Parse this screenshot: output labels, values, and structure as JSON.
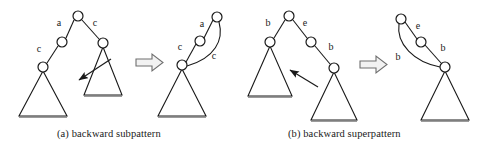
{
  "figure": {
    "width": 489,
    "height": 157,
    "background": "#ffffff",
    "stroke_color": "#1a1a1a",
    "node_fill": "#ffffff",
    "arrow_fill": "#f2f2f2"
  },
  "panels": [
    {
      "id": "a",
      "caption": "(a) backward subpattern",
      "before": {
        "nodes": [
          {
            "name": "root",
            "cx": 78,
            "cy": 16,
            "r": 5
          },
          {
            "name": "left-child",
            "cx": 62,
            "cy": 42,
            "r": 5
          },
          {
            "name": "right-child",
            "cx": 103,
            "cy": 43,
            "r": 5
          },
          {
            "name": "left-grandchild",
            "cx": 43,
            "cy": 67,
            "r": 5
          }
        ],
        "edges": [
          {
            "from": "root",
            "to": "left-child",
            "label": "a",
            "label_x": 62,
            "label_y": 23
          },
          {
            "from": "root",
            "to": "right-child",
            "label": "c",
            "label_x": 95,
            "label_y": 23
          },
          {
            "from": "left-child",
            "to": "left-grandchild",
            "label": "c",
            "label_x": 42,
            "label_y": 49
          }
        ],
        "triangles": [
          {
            "name": "left-subtree-triangle",
            "apex_x": 43,
            "apex_y": 71,
            "base_y": 116,
            "half_width": 24
          },
          {
            "name": "right-subtree-triangle",
            "apex_x": 103,
            "apex_y": 47,
            "base_y": 95,
            "half_width": 19
          }
        ],
        "pointer_arrow": {
          "name": "match-pointer-arrow",
          "x1": 110,
          "y1": 60,
          "x2": 77,
          "y2": 81
        }
      },
      "transform_arrow": {
        "name": "implies-arrow",
        "x": 136,
        "y": 54,
        "w": 26,
        "h": 17
      },
      "after": {
        "nodes": [
          {
            "name": "root",
            "cx": 217,
            "cy": 17,
            "r": 5
          },
          {
            "name": "mid",
            "cx": 200,
            "cy": 41,
            "r": 5
          },
          {
            "name": "bottom",
            "cx": 182,
            "cy": 65,
            "r": 5
          }
        ],
        "edges": [
          {
            "from": "root",
            "to": "mid",
            "label": "a",
            "label_x": 201,
            "label_y": 24
          },
          {
            "from": "mid",
            "to": "bottom",
            "label": "c",
            "label_x": 181,
            "label_y": 47
          }
        ],
        "back_edge": {
          "name": "backward-edge",
          "label": "c",
          "label_x": 212,
          "label_y": 56
        },
        "triangles": [
          {
            "name": "subtree-triangle",
            "apex_x": 182,
            "apex_y": 69,
            "base_y": 116,
            "half_width": 24
          }
        ]
      }
    },
    {
      "id": "b",
      "caption": "(b) backward superpattern",
      "before": {
        "nodes": [
          {
            "name": "root",
            "cx": 289,
            "cy": 16,
            "r": 5
          },
          {
            "name": "left-child",
            "cx": 270,
            "cy": 42,
            "r": 5
          },
          {
            "name": "right-child",
            "cx": 311,
            "cy": 42,
            "r": 5
          },
          {
            "name": "right-grandchild",
            "cx": 334,
            "cy": 68,
            "r": 5
          }
        ],
        "edges": [
          {
            "from": "root",
            "to": "left-child",
            "label": "b",
            "label_x": 269,
            "label_y": 23
          },
          {
            "from": "root",
            "to": "right-child",
            "label": "e",
            "label_x": 305,
            "label_y": 23
          },
          {
            "from": "right-child",
            "to": "right-grandchild",
            "label": "b",
            "label_x": 330,
            "label_y": 49
          }
        ],
        "triangles": [
          {
            "name": "left-subtree-triangle",
            "apex_x": 270,
            "apex_y": 46,
            "base_y": 96,
            "half_width": 22
          },
          {
            "name": "right-subtree-triangle",
            "apex_x": 334,
            "apex_y": 72,
            "base_y": 120,
            "half_width": 23
          }
        ],
        "pointer_arrow": {
          "name": "match-pointer-arrow",
          "x1": 316,
          "y1": 86,
          "x2": 288,
          "y2": 70
        }
      },
      "transform_arrow": {
        "name": "implies-arrow",
        "x": 360,
        "y": 57,
        "w": 26,
        "h": 17
      },
      "after": {
        "nodes": [
          {
            "name": "root",
            "cx": 401,
            "cy": 19,
            "r": 5
          },
          {
            "name": "mid",
            "cx": 421,
            "cy": 42,
            "r": 5
          },
          {
            "name": "bottom",
            "cx": 445,
            "cy": 67,
            "r": 5
          }
        ],
        "edges": [
          {
            "from": "root",
            "to": "mid",
            "label": "e",
            "label_x": 417,
            "label_y": 26
          },
          {
            "from": "mid",
            "to": "bottom",
            "label": "b",
            "label_x": 441,
            "label_y": 48
          }
        ],
        "back_edge": {
          "name": "backward-edge",
          "label": "b",
          "label_x": 399,
          "label_y": 57
        },
        "triangles": [
          {
            "name": "subtree-triangle",
            "apex_x": 445,
            "apex_y": 71,
            "base_y": 120,
            "half_width": 24
          }
        ]
      }
    }
  ]
}
